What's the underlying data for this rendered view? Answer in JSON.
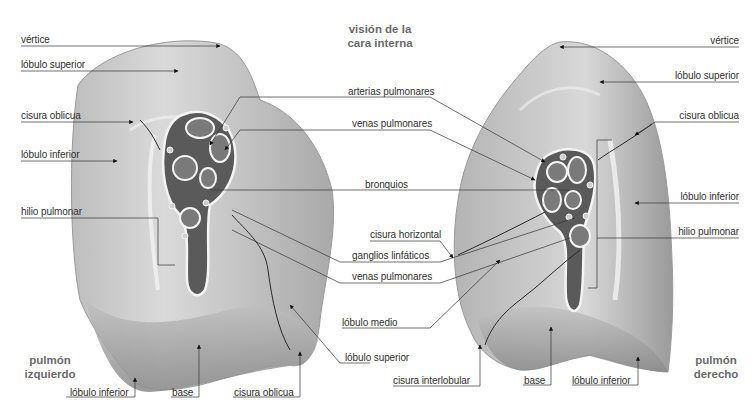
{
  "figure": {
    "view_title_line1": "visión de la",
    "view_title_line2": "cara interna",
    "left_lung": {
      "name_line1": "pulmón",
      "name_line2": "izquierdo",
      "labels": {
        "vertice": "vértice",
        "lobulo_superior": "lóbulo superior",
        "cisura_oblicua": "cisura oblicua",
        "lobulo_inferior": "lóbulo inferior",
        "hilio_pulmonar": "hilio pulmonar",
        "bottom_lobulo_inferior": "lóbulo inferior",
        "bottom_base": "base",
        "bottom_cisura_oblicua": "cisura oblicua",
        "lobulo_superior_medial": "lóbulo superior"
      }
    },
    "right_lung": {
      "name_line1": "pulmón",
      "name_line2": "derecho",
      "labels": {
        "vertice": "vértice",
        "lobulo_superior": "lóbulo superior",
        "cisura_oblicua": "cisura oblicua",
        "lobulo_inferior": "lóbulo inferior",
        "hilio_pulmonar": "hilio pulmonar",
        "cisura_horizontal": "cisura horizontal",
        "lobulo_medio": "lóbulo medio",
        "cisura_interlobular": "cisura interlobular",
        "bottom_base": "base",
        "bottom_lobulo_inferior": "lóbulo inferior"
      }
    },
    "center_labels": {
      "arterias_pulmonares": "arterias pulmonares",
      "venas_pulmonares_top": "venas pulmonares",
      "bronquios": "bronquios",
      "ganglios_linfaticos": "ganglios linfáticos",
      "venas_pulmonares_bottom": "venas pulmonares"
    },
    "colors": {
      "lung_fill": "#c9c9c9",
      "lung_light": "#e2e2e2",
      "lung_shadow": "#8e8e8e",
      "hilum_dark": "#5a5a5a",
      "vessel_outline": "#f4f4f4",
      "leader_line": "#333333",
      "label_text": "#333333",
      "title_text": "#6b6b6b"
    }
  }
}
